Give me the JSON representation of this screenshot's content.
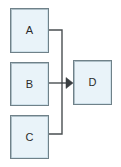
{
  "diagram": {
    "canvas": {
      "width": 121,
      "height": 167,
      "background": "#ffffff"
    },
    "style": {
      "node_fill": "#e9f3f9",
      "node_border": "#6f8189",
      "node_highlight": "#cfe1ea",
      "node_shadow": "#aebfc7",
      "edge_color": "#4a4f52",
      "label_color": "#2b2b2b"
    },
    "nodes": [
      {
        "id": "a",
        "label": "A",
        "x": 10,
        "y": 8,
        "width": 39,
        "height": 45
      },
      {
        "id": "b",
        "label": "B",
        "x": 10,
        "y": 62,
        "width": 39,
        "height": 44
      },
      {
        "id": "c",
        "label": "C",
        "x": 10,
        "y": 115,
        "width": 39,
        "height": 44
      },
      {
        "id": "d",
        "label": "D",
        "x": 73,
        "y": 60,
        "width": 39,
        "height": 45
      }
    ],
    "edges": [
      {
        "id": "a-d",
        "from": "A",
        "to": "D",
        "routing": "orthogonal",
        "arrowhead": false
      },
      {
        "id": "b-d",
        "from": "B",
        "to": "D",
        "routing": "straight",
        "arrowhead": true
      },
      {
        "id": "c-d",
        "from": "C",
        "to": "D",
        "routing": "orthogonal",
        "arrowhead": false
      }
    ],
    "arrowhead": {
      "shape": "solid-triangle",
      "direction": "right",
      "x": 66,
      "y": 82
    }
  }
}
